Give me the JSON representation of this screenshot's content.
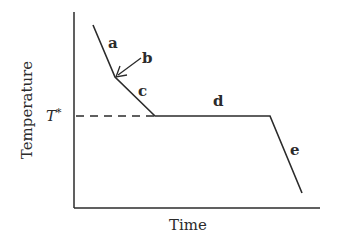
{
  "diagram": {
    "type": "cooling-curve",
    "axes": {
      "xlabel": "Time",
      "ylabel": "Temperature"
    },
    "reference_line": {
      "label": "T",
      "label_superscript": "*",
      "style": "dashed"
    },
    "segments": [
      {
        "id": "a",
        "label": "a",
        "description": "steep initial cooling"
      },
      {
        "id": "b",
        "label": "b",
        "description": "kink point (arrow)"
      },
      {
        "id": "c",
        "label": "c",
        "description": "slower cooling down to T*"
      },
      {
        "id": "d",
        "label": "d",
        "description": "plateau at T*"
      },
      {
        "id": "e",
        "label": "e",
        "description": "steep cooling after plateau"
      }
    ],
    "colors": {
      "line": "#2b2b2b",
      "background": "#ffffff"
    }
  }
}
